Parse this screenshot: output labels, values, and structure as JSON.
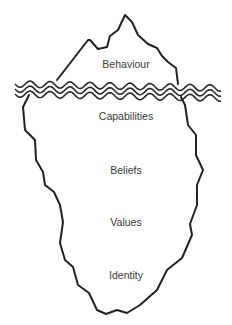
{
  "diagram": {
    "type": "iceberg",
    "colors": {
      "stroke": "#222222",
      "text": "#3a3a3a",
      "background": "#ffffff"
    },
    "above_water": {
      "label": "Behaviour"
    },
    "below_water": [
      {
        "label": "Capabilities"
      },
      {
        "label": "Beliefs"
      },
      {
        "label": "Values"
      },
      {
        "label": "Identity"
      }
    ],
    "water_lines": 3
  }
}
